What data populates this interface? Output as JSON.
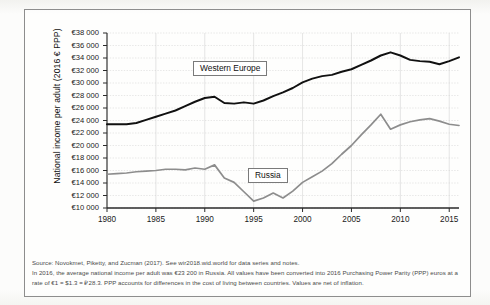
{
  "chart_data": {
    "type": "line",
    "title": "",
    "subtitle": "",
    "xlabel": "",
    "ylabel": "National income per adult (2016 € PPP)",
    "xlim": [
      1980,
      2016
    ],
    "ylim": [
      10000,
      38000
    ],
    "grid": true,
    "legend_position": "inline-annotations",
    "x_tick_labels": [
      "1980",
      "1985",
      "1990",
      "1995",
      "2000",
      "2005",
      "2010",
      "2015"
    ],
    "x_ticks": [
      1980,
      1985,
      1990,
      1995,
      2000,
      2005,
      2010,
      2015
    ],
    "y_tick_labels": [
      "€10 000",
      "€12 000",
      "€14 000",
      "€16 000",
      "€18 000",
      "€20 000",
      "€22 000",
      "€24 000",
      "€26 000",
      "€28 000",
      "€30 000",
      "€32 000",
      "€34 000",
      "€36 000",
      "€38 000"
    ],
    "y_ticks": [
      10000,
      12000,
      14000,
      16000,
      18000,
      20000,
      22000,
      24000,
      26000,
      28000,
      30000,
      32000,
      34000,
      36000,
      38000
    ],
    "x": [
      1980,
      1981,
      1982,
      1983,
      1984,
      1985,
      1986,
      1987,
      1988,
      1989,
      1990,
      1991,
      1992,
      1993,
      1994,
      1995,
      1996,
      1997,
      1998,
      1999,
      2000,
      2001,
      2002,
      2003,
      2004,
      2005,
      2006,
      2007,
      2008,
      2009,
      2010,
      2011,
      2012,
      2013,
      2014,
      2015,
      2016
    ],
    "series": [
      {
        "name": "Western Europe",
        "color": "#111111",
        "values": [
          23400,
          23400,
          23400,
          23600,
          24100,
          24600,
          25100,
          25600,
          26300,
          27000,
          27600,
          27800,
          26800,
          26700,
          26900,
          26700,
          27200,
          27900,
          28500,
          29200,
          30100,
          30700,
          31100,
          31300,
          31800,
          32200,
          32900,
          33600,
          34400,
          34900,
          34400,
          33700,
          33500,
          33400,
          33000,
          33500,
          34100
        ]
      },
      {
        "name": "Russia",
        "color": "#8d8d8d",
        "values": [
          15400,
          15500,
          15600,
          15800,
          15900,
          16000,
          16200,
          16200,
          16100,
          16400,
          16200,
          16900,
          14800,
          14100,
          12600,
          11100,
          11600,
          12400,
          11600,
          12700,
          14100,
          15000,
          15900,
          17100,
          18600,
          20000,
          21700,
          23300,
          25000,
          22600,
          23300,
          23800,
          24100,
          24300,
          23900,
          23400,
          23200
        ]
      }
    ],
    "annotations": [
      {
        "text": "Western Europe",
        "series": "Western Europe"
      },
      {
        "text": "Russia",
        "series": "Russia"
      }
    ]
  },
  "notes": {
    "line1": "Source:  Novokmet, Piketty, and Zucman (2017). See wir2018.wid.world for data series and notes.",
    "line2": "In 2016, the average national income per adult was €23 200 in Russia. All values have been converted into 2016 Purchasing Power Parity (PPP) euros at a rate of €1 = $1.3 = ₽28.3. PPP accounts for differences in the cost of living between countries. Values are net of inflation."
  }
}
